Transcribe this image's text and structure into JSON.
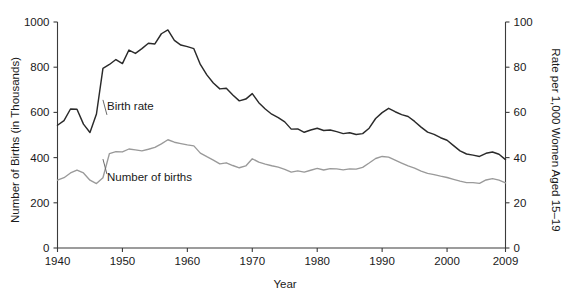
{
  "chart_data": {
    "type": "line",
    "title": "",
    "xlabel": "Year",
    "ylabel": "Number of Births (in Thousands)",
    "y2label": "Rate per 1,000 Women Aged 15–19",
    "xlim": [
      1940,
      2009
    ],
    "ylim": [
      0,
      1000
    ],
    "y2lim": [
      0,
      100
    ],
    "grid": false,
    "legend_position": "inline-annotations",
    "xticks": [
      1940,
      1950,
      1960,
      1970,
      1980,
      1990,
      2000,
      2009
    ],
    "xtick_labels": [
      "1940",
      "1950",
      "1960",
      "1970",
      "1980",
      "1990",
      "2000",
      "2009"
    ],
    "yticks": [
      0,
      200,
      400,
      600,
      800,
      1000
    ],
    "ytick_labels": [
      "0",
      "200",
      "400",
      "600",
      "800",
      "1000"
    ],
    "y2ticks": [
      0,
      20,
      40,
      60,
      80,
      100
    ],
    "y2tick_labels": [
      "0",
      "20",
      "40",
      "60",
      "80",
      "100"
    ],
    "x": [
      1940,
      1941,
      1942,
      1943,
      1944,
      1945,
      1946,
      1947,
      1948,
      1949,
      1950,
      1951,
      1952,
      1953,
      1954,
      1955,
      1956,
      1957,
      1958,
      1959,
      1960,
      1961,
      1962,
      1963,
      1964,
      1965,
      1966,
      1967,
      1968,
      1969,
      1970,
      1971,
      1972,
      1973,
      1974,
      1975,
      1976,
      1977,
      1978,
      1979,
      1980,
      1981,
      1982,
      1983,
      1984,
      1985,
      1986,
      1987,
      1988,
      1989,
      1990,
      1991,
      1992,
      1993,
      1994,
      1995,
      1996,
      1997,
      1998,
      1999,
      2000,
      2001,
      2002,
      2003,
      2004,
      2005,
      2006,
      2007,
      2008,
      2009
    ],
    "series": [
      {
        "name": "Birth rate",
        "axis": "right",
        "units": "rate per 1,000 women aged 15-19",
        "color": "#2a2a2a",
        "values": [
          54.3,
          56.4,
          61.5,
          61.4,
          54.8,
          51.1,
          59.3,
          79.5,
          81.2,
          83.4,
          81.6,
          87.6,
          86.1,
          88.2,
          90.6,
          90.3,
          94.8,
          96.5,
          91.9,
          89.8,
          89.1,
          88.2,
          81.2,
          76.6,
          73.0,
          70.4,
          70.7,
          67.7,
          65.1,
          65.9,
          68.3,
          64.3,
          61.5,
          59.2,
          57.7,
          55.8,
          52.6,
          52.7,
          51.2,
          52.2,
          53.0,
          52.0,
          52.2,
          51.5,
          50.6,
          51.0,
          50.2,
          50.6,
          53.0,
          57.3,
          59.9,
          61.8,
          60.3,
          59.0,
          58.2,
          56.0,
          53.5,
          51.3,
          50.3,
          48.8,
          47.7,
          45.3,
          43.0,
          41.6,
          41.1,
          40.5,
          41.9,
          42.5,
          41.5,
          39.1
        ]
      },
      {
        "name": "Number of births",
        "axis": "left",
        "units": "thousands",
        "color": "#9a9a9a",
        "values": [
          300,
          311,
          332,
          345,
          332,
          300,
          285,
          311,
          418,
          426,
          425,
          438,
          434,
          430,
          437,
          445,
          461,
          479,
          468,
          462,
          456,
          452,
          420,
          404,
          389,
          372,
          377,
          365,
          355,
          363,
          395,
          380,
          371,
          364,
          358,
          348,
          336,
          341,
          336,
          344,
          352,
          345,
          351,
          350,
          346,
          350,
          349,
          357,
          376,
          396,
          405,
          402,
          389,
          376,
          363,
          353,
          340,
          330,
          325,
          318,
          312,
          304,
          296,
          289,
          289,
          286,
          301,
          307,
          300,
          288
        ]
      }
    ],
    "annotations": [
      {
        "text": "Birth rate",
        "x": 1947.0,
        "y_rate": 62.0
      },
      {
        "text": "Number of births",
        "x": 1947.0,
        "y_thousands": 358
      }
    ]
  },
  "axes": {
    "left_title": "Number of Births (in Thousands)",
    "right_title": "Rate per 1,000 Women Aged 15–19",
    "bottom_title": "Year"
  },
  "labels": {
    "birth_rate": "Birth rate",
    "number_of_births": "Number of births"
  }
}
